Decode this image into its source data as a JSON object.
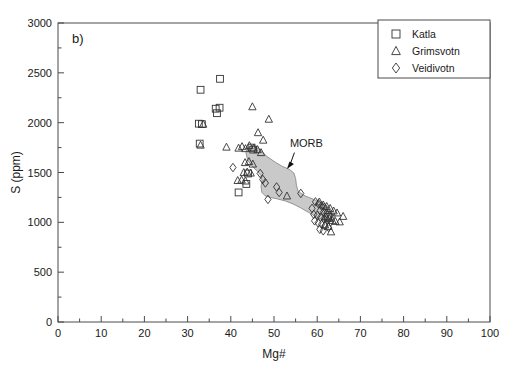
{
  "figure": {
    "panel_label": "b)",
    "background_color": "#ffffff"
  },
  "chart_data": {
    "type": "scatter",
    "title": "",
    "xlabel": "Mg#",
    "ylabel": "S (ppm)",
    "xlim": [
      0,
      100
    ],
    "ylim": [
      0,
      3000
    ],
    "xticks": [
      0,
      10,
      20,
      30,
      40,
      50,
      60,
      70,
      80,
      90,
      100
    ],
    "xtick_labels": [
      "0",
      "10",
      "20",
      "30",
      "40",
      "50",
      "60",
      "70",
      "80",
      "90",
      "100"
    ],
    "x_minor_tick_interval": 5,
    "yticks": [
      0,
      500,
      1000,
      1500,
      2000,
      2500,
      3000
    ],
    "ytick_labels": [
      "0",
      "500",
      "1000",
      "1500",
      "2000",
      "2500",
      "3000"
    ],
    "y_minor_tick_interval": 250,
    "grid": false,
    "legend_position": "top-right",
    "marker_edge_color": "#333333",
    "marker_face_color": "none",
    "series": [
      {
        "name": "Katla",
        "marker": "square",
        "points": [
          [
            37.5,
            2440
          ],
          [
            33.0,
            2330
          ],
          [
            36.5,
            2140
          ],
          [
            37.4,
            2150
          ],
          [
            36.8,
            2095
          ],
          [
            32.6,
            1990
          ],
          [
            33.3,
            1985
          ],
          [
            32.8,
            1790
          ],
          [
            44.8,
            1750
          ],
          [
            45.2,
            1730
          ],
          [
            44.0,
            1490
          ],
          [
            43.6,
            1385
          ],
          [
            41.8,
            1300
          ],
          [
            62.5,
            1055
          ]
        ]
      },
      {
        "name": "Grimsvotn",
        "marker": "triangle",
        "points": [
          [
            45.0,
            2160
          ],
          [
            48.8,
            2035
          ],
          [
            46.3,
            1900
          ],
          [
            47.5,
            1825
          ],
          [
            39.0,
            1755
          ],
          [
            41.8,
            1745
          ],
          [
            42.6,
            1760
          ],
          [
            43.4,
            1740
          ],
          [
            44.3,
            1770
          ],
          [
            45.3,
            1745
          ],
          [
            46.2,
            1730
          ],
          [
            47.0,
            1700
          ],
          [
            33.6,
            1985
          ],
          [
            33.0,
            1775
          ],
          [
            43.3,
            1600
          ],
          [
            44.2,
            1610
          ],
          [
            45.1,
            1585
          ],
          [
            43.0,
            1500
          ],
          [
            43.8,
            1505
          ],
          [
            44.6,
            1495
          ],
          [
            41.6,
            1420
          ],
          [
            42.5,
            1425
          ],
          [
            43.4,
            1415
          ],
          [
            53.0,
            1265
          ],
          [
            60.5,
            1205
          ],
          [
            61.4,
            1175
          ],
          [
            62.2,
            1160
          ],
          [
            63.0,
            1140
          ],
          [
            63.8,
            1115
          ],
          [
            64.6,
            1095
          ],
          [
            62.0,
            1060
          ],
          [
            62.8,
            1040
          ],
          [
            63.5,
            1020
          ],
          [
            64.2,
            1010
          ],
          [
            61.8,
            975
          ],
          [
            62.6,
            960
          ],
          [
            66.0,
            1060
          ],
          [
            65.2,
            1005
          ],
          [
            63.2,
            905
          ]
        ]
      },
      {
        "name": "Veidivotn",
        "marker": "diamond",
        "points": [
          [
            40.5,
            1550
          ],
          [
            46.8,
            1490
          ],
          [
            47.4,
            1430
          ],
          [
            48.0,
            1395
          ],
          [
            50.6,
            1355
          ],
          [
            51.2,
            1300
          ],
          [
            48.6,
            1230
          ],
          [
            56.2,
            1290
          ],
          [
            59.6,
            1205
          ],
          [
            60.3,
            1185
          ],
          [
            61.0,
            1165
          ],
          [
            61.7,
            1150
          ],
          [
            60.7,
            1120
          ],
          [
            61.5,
            1105
          ],
          [
            62.2,
            1090
          ],
          [
            62.9,
            1075
          ],
          [
            60.0,
            1070
          ],
          [
            60.8,
            1050
          ],
          [
            61.6,
            1035
          ],
          [
            62.4,
            1020
          ],
          [
            63.1,
            1005
          ],
          [
            59.4,
            1015
          ],
          [
            60.2,
            995
          ],
          [
            61.0,
            980
          ],
          [
            61.8,
            965
          ],
          [
            62.6,
            950
          ],
          [
            60.6,
            930
          ],
          [
            61.4,
            915
          ],
          [
            58.8,
            1140
          ],
          [
            59.2,
            1080
          ]
        ]
      }
    ],
    "annotations": [
      {
        "text": "MORB",
        "kind": "arrow-label",
        "label_x": 57.5,
        "label_y": 1760,
        "target_x": 53.0,
        "target_y": 1535
      }
    ],
    "shaded_fields": [
      {
        "name": "MORB",
        "fill_color": "#c9c9c9",
        "edge_color": "#8a8a8a",
        "polygon": [
          [
            44.8,
            1770
          ],
          [
            46.6,
            1735
          ],
          [
            48.4,
            1660
          ],
          [
            50.4,
            1600
          ],
          [
            52.0,
            1560
          ],
          [
            53.6,
            1530
          ],
          [
            54.6,
            1495
          ],
          [
            55.0,
            1440
          ],
          [
            55.2,
            1370
          ],
          [
            55.6,
            1310
          ],
          [
            57.2,
            1265
          ],
          [
            59.2,
            1230
          ],
          [
            60.8,
            1195
          ],
          [
            62.4,
            1145
          ],
          [
            63.6,
            1105
          ],
          [
            64.2,
            1070
          ],
          [
            64.0,
            1035
          ],
          [
            63.0,
            1010
          ],
          [
            61.6,
            1015
          ],
          [
            60.0,
            1050
          ],
          [
            58.2,
            1095
          ],
          [
            56.2,
            1145
          ],
          [
            54.4,
            1185
          ],
          [
            52.6,
            1215
          ],
          [
            50.8,
            1235
          ],
          [
            49.2,
            1250
          ],
          [
            48.0,
            1265
          ],
          [
            47.2,
            1300
          ],
          [
            47.0,
            1355
          ],
          [
            47.2,
            1420
          ],
          [
            47.0,
            1470
          ],
          [
            46.2,
            1510
          ],
          [
            45.0,
            1560
          ],
          [
            43.9,
            1625
          ],
          [
            43.5,
            1700
          ],
          [
            43.8,
            1745
          ]
        ]
      }
    ],
    "legend": [
      {
        "label": "Katla",
        "marker": "square"
      },
      {
        "label": "Grimsvotn",
        "marker": "triangle"
      },
      {
        "label": "Veidivotn",
        "marker": "diamond"
      }
    ]
  }
}
